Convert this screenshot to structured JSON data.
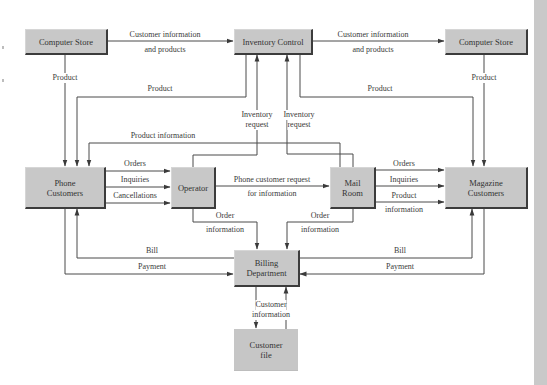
{
  "diagram": {
    "type": "data-flow-diagram",
    "nodes": {
      "computer_store_left": "Computer Store",
      "inventory_control": "Inventory Control",
      "computer_store_right": "Computer Store",
      "phone_customers": "Phone\nCustomers",
      "operator": "Operator",
      "mail_room": "Mail\nRoom",
      "magazine_customers": "Magazine\nCustomers",
      "billing_department": "Billing\nDepartment",
      "customer_file": "Customer\nfile"
    },
    "edge_labels": {
      "cs_left_to_ic_1": "Customer information",
      "cs_left_to_ic_2": "and products",
      "ic_to_cs_right_1": "Customer information",
      "ic_to_cs_right_2": "and products",
      "cs_left_product": "Product",
      "cs_right_product": "Product",
      "ic_product_left": "Product",
      "ic_product_right": "Product",
      "inventory_request_1a": "Inventory",
      "inventory_request_1b": "request",
      "inventory_request_2a": "Inventory",
      "inventory_request_2b": "request",
      "product_information": "Product information",
      "orders_left": "Orders",
      "inquiries_left": "Inquiries",
      "cancellations": "Cancellations",
      "phone_request_1": "Phone customer request",
      "phone_request_2": "for information",
      "orders_right": "Orders",
      "inquiries_right": "Inquiries",
      "product_info_right_1": "Product",
      "product_info_right_2": "information",
      "order_info_op_1": "Order",
      "order_info_op_2": "information",
      "order_info_mr_1": "Order",
      "order_info_mr_2": "information",
      "bill_left": "Bill",
      "payment_left": "Payment",
      "bill_right": "Bill",
      "payment_right": "Payment",
      "customer_info_1": "Customer",
      "customer_info_2": "information"
    },
    "colors": {
      "box_fill": "#c8c8c8",
      "box_shadow": "#3c3c3c",
      "line": "#4a4a4a",
      "sidebar": "#c9c9c9"
    }
  }
}
